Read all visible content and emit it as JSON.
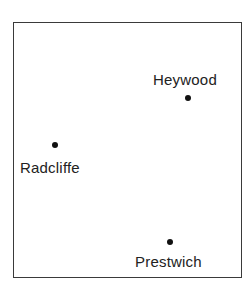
{
  "map": {
    "frame": {
      "border_color": "#3a3a3a"
    },
    "towns": [
      {
        "name": "Heywood",
        "dot": {
          "x": 188,
          "y": 98
        },
        "label": {
          "x": 153,
          "y": 72
        }
      },
      {
        "name": "Radcliffe",
        "dot": {
          "x": 55,
          "y": 145
        },
        "label": {
          "x": 20,
          "y": 160
        }
      },
      {
        "name": "Prestwich",
        "dot": {
          "x": 170,
          "y": 242
        },
        "label": {
          "x": 135,
          "y": 254
        }
      }
    ]
  }
}
